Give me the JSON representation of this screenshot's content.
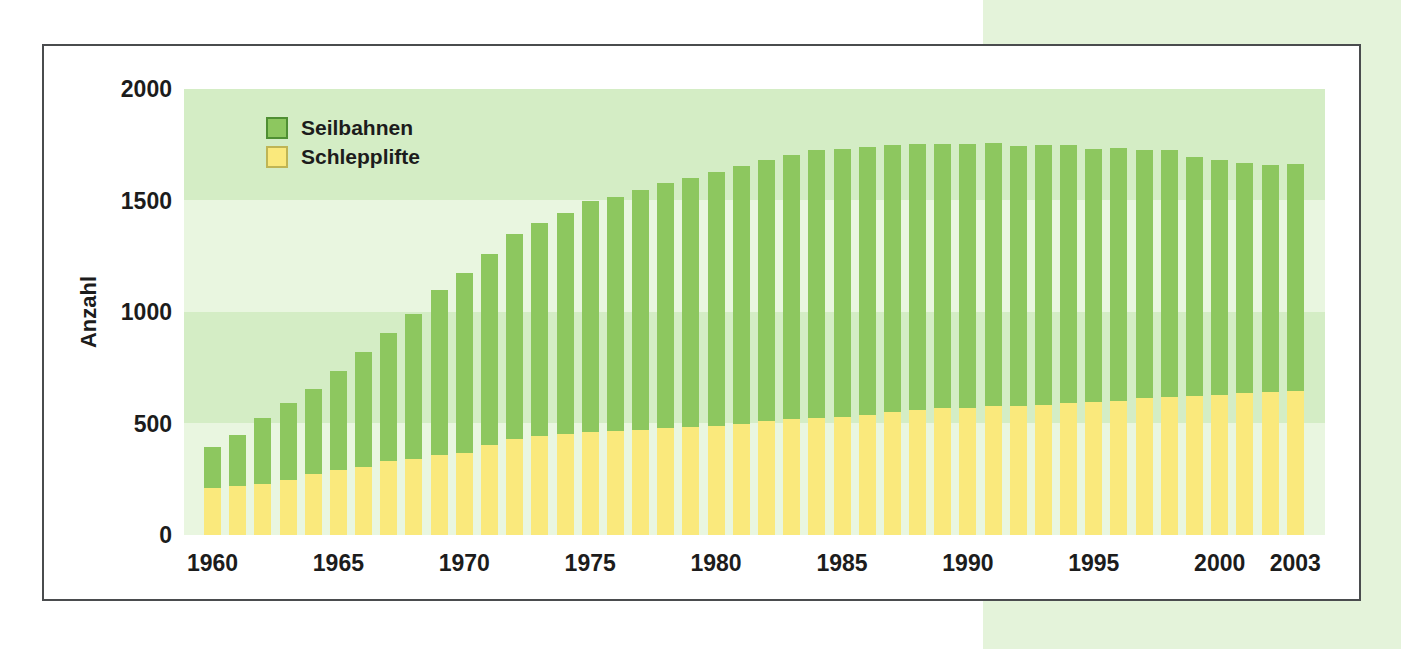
{
  "page": {
    "background_color": "#ffffff",
    "side_band_color": "#e4f3da",
    "frame_border_color": "#4a4c4e",
    "band_color_dark": "#d4edc5",
    "band_color_light": "#e9f6e0",
    "text_color": "#1c1c1c"
  },
  "chart_data": {
    "type": "bar",
    "stacked": true,
    "title": "",
    "xlabel": "",
    "ylabel": "Anzahl",
    "ylim": [
      0,
      2000
    ],
    "y_tick_interval": 500,
    "y_ticks": [
      0,
      500,
      1000,
      1500,
      2000
    ],
    "x_ticks": [
      1960,
      1965,
      1970,
      1975,
      1980,
      1985,
      1990,
      1995,
      2000,
      2003
    ],
    "grid": "horizontal shaded bands every 500 units, alternating light/dark green",
    "legend_position": "top-left inside plot",
    "categories": [
      1960,
      1961,
      1962,
      1963,
      1964,
      1965,
      1966,
      1967,
      1968,
      1969,
      1970,
      1971,
      1972,
      1973,
      1974,
      1975,
      1976,
      1977,
      1978,
      1979,
      1980,
      1981,
      1982,
      1983,
      1984,
      1985,
      1986,
      1987,
      1988,
      1989,
      1990,
      1991,
      1992,
      1993,
      1994,
      1995,
      1996,
      1997,
      1998,
      1999,
      2000,
      2001,
      2002,
      2003
    ],
    "series": [
      {
        "name": "Schlepplifte",
        "color": "#fae97c",
        "swatch_border_color": "#bfb554",
        "values": [
          210,
          220,
          230,
          245,
          275,
          290,
          305,
          330,
          340,
          360,
          370,
          405,
          430,
          445,
          455,
          460,
          465,
          470,
          480,
          485,
          490,
          500,
          510,
          520,
          525,
          530,
          540,
          550,
          560,
          570,
          570,
          580,
          580,
          585,
          590,
          595,
          600,
          615,
          620,
          625,
          630,
          635,
          640,
          645
        ]
      },
      {
        "name": "Seilbahnen",
        "color": "#8dc75f",
        "swatch_border_color": "#4f8f33",
        "values": [
          185,
          230,
          295,
          345,
          380,
          445,
          515,
          575,
          650,
          740,
          805,
          855,
          920,
          955,
          990,
          1040,
          1050,
          1075,
          1100,
          1115,
          1140,
          1155,
          1170,
          1185,
          1200,
          1200,
          1200,
          1200,
          1195,
          1185,
          1185,
          1180,
          1165,
          1165,
          1160,
          1135,
          1135,
          1110,
          1105,
          1070,
          1050,
          1035,
          1020,
          1020
        ]
      }
    ]
  }
}
